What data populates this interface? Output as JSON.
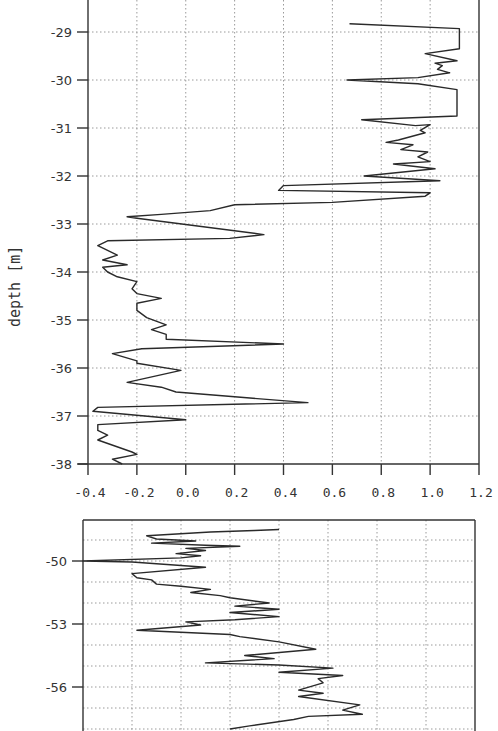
{
  "chart_data": [
    {
      "type": "line",
      "orientation": "profile (x = value, y = depth)",
      "title": "",
      "xlabel": "",
      "ylabel": "depth [m]",
      "xlim": [
        -0.4,
        1.2
      ],
      "ylim": [
        -38,
        -28.4
      ],
      "x_ticks": [
        "-0.4",
        "-0.2",
        "0.0",
        "0.2",
        "0.4",
        "0.6",
        "0.8",
        "1.0",
        "1.2"
      ],
      "y_ticks": [
        "-29",
        "-30",
        "-31",
        "-32",
        "-33",
        "-34",
        "-35",
        "-36",
        "-37",
        "-38"
      ],
      "grid": true,
      "series": [
        {
          "name": "profile",
          "points": [
            [
              0.67,
              -28.83
            ],
            [
              1.12,
              -28.93
            ],
            [
              1.12,
              -29.35
            ],
            [
              0.98,
              -29.45
            ],
            [
              1.11,
              -29.6
            ],
            [
              1.02,
              -29.65
            ],
            [
              1.05,
              -29.7
            ],
            [
              1.03,
              -29.78
            ],
            [
              1.08,
              -29.85
            ],
            [
              0.95,
              -29.95
            ],
            [
              0.66,
              -30.0
            ],
            [
              0.95,
              -30.08
            ],
            [
              1.11,
              -30.2
            ],
            [
              1.11,
              -30.75
            ],
            [
              0.72,
              -30.83
            ],
            [
              0.94,
              -30.95
            ],
            [
              1.0,
              -30.93
            ],
            [
              0.96,
              -31.05
            ],
            [
              0.98,
              -31.1
            ],
            [
              0.87,
              -31.25
            ],
            [
              0.82,
              -31.3
            ],
            [
              0.93,
              -31.35
            ],
            [
              0.88,
              -31.45
            ],
            [
              0.99,
              -31.5
            ],
            [
              0.95,
              -31.6
            ],
            [
              1.0,
              -31.7
            ],
            [
              0.85,
              -31.75
            ],
            [
              1.02,
              -31.85
            ],
            [
              0.73,
              -32.0
            ],
            [
              1.04,
              -32.1
            ],
            [
              0.4,
              -32.2
            ],
            [
              0.38,
              -32.3
            ],
            [
              1.0,
              -32.35
            ],
            [
              0.98,
              -32.42
            ],
            [
              0.6,
              -32.55
            ],
            [
              0.2,
              -32.6
            ],
            [
              0.1,
              -32.72
            ],
            [
              -0.1,
              -32.8
            ],
            [
              -0.24,
              -32.85
            ],
            [
              -0.2,
              -32.88
            ],
            [
              0.32,
              -33.22
            ],
            [
              0.18,
              -33.3
            ],
            [
              -0.32,
              -33.35
            ],
            [
              -0.36,
              -33.45
            ],
            [
              -0.28,
              -33.65
            ],
            [
              -0.34,
              -33.75
            ],
            [
              -0.24,
              -33.85
            ],
            [
              -0.34,
              -33.9
            ],
            [
              -0.32,
              -34.0
            ],
            [
              -0.28,
              -34.1
            ],
            [
              -0.2,
              -34.2
            ],
            [
              -0.22,
              -34.35
            ],
            [
              -0.2,
              -34.45
            ],
            [
              -0.1,
              -34.55
            ],
            [
              -0.2,
              -34.65
            ],
            [
              -0.2,
              -34.8
            ],
            [
              -0.16,
              -34.95
            ],
            [
              -0.08,
              -35.1
            ],
            [
              -0.14,
              -35.2
            ],
            [
              -0.08,
              -35.3
            ],
            [
              -0.08,
              -35.4
            ],
            [
              0.4,
              -35.5
            ],
            [
              -0.18,
              -35.6
            ],
            [
              -0.3,
              -35.7
            ],
            [
              -0.2,
              -35.85
            ],
            [
              -0.2,
              -35.9
            ],
            [
              -0.02,
              -36.05
            ],
            [
              -0.24,
              -36.3
            ],
            [
              -0.1,
              -36.4
            ],
            [
              -0.04,
              -36.5
            ],
            [
              0.2,
              -36.6
            ],
            [
              0.5,
              -36.72
            ],
            [
              -0.36,
              -36.82
            ],
            [
              -0.38,
              -36.9
            ],
            [
              0.0,
              -37.08
            ],
            [
              -0.36,
              -37.18
            ],
            [
              -0.36,
              -37.3
            ],
            [
              -0.32,
              -37.4
            ],
            [
              -0.36,
              -37.5
            ],
            [
              -0.22,
              -37.75
            ],
            [
              -0.2,
              -37.8
            ],
            [
              -0.3,
              -37.9
            ],
            [
              -0.26,
              -38.0
            ]
          ]
        }
      ]
    },
    {
      "type": "line",
      "orientation": "profile (x = value, y = depth)",
      "title": "",
      "xlabel": "",
      "ylabel": "",
      "xlim": [
        -0.4,
        1.2
      ],
      "ylim": [
        -48.0,
        -58.0
      ],
      "x_ticks": [],
      "y_ticks": [
        "-50",
        "-53",
        "-56"
      ],
      "grid": true,
      "note": "lower panel cropped at bottom edge of image; x gridlines appear at same 0.2 spacing as upper panel",
      "series": [
        {
          "name": "profile",
          "points": [
            [
              0.4,
              -48.5
            ],
            [
              0.3,
              -48.55
            ],
            [
              0.12,
              -48.62
            ],
            [
              -0.14,
              -48.8
            ],
            [
              -0.1,
              -48.95
            ],
            [
              0.06,
              -49.05
            ],
            [
              -0.12,
              -49.15
            ],
            [
              0.1,
              -49.25
            ],
            [
              0.24,
              -49.3
            ],
            [
              0.02,
              -49.4
            ],
            [
              0.1,
              -49.5
            ],
            [
              -0.02,
              -49.65
            ],
            [
              0.08,
              -49.75
            ],
            [
              0.0,
              -49.85
            ],
            [
              -0.4,
              -50.0
            ],
            [
              -0.2,
              -50.05
            ],
            [
              0.1,
              -50.3
            ],
            [
              -0.2,
              -50.6
            ],
            [
              -0.18,
              -50.8
            ],
            [
              -0.12,
              -50.9
            ],
            [
              -0.1,
              -51.1
            ],
            [
              0.0,
              -51.2
            ],
            [
              0.12,
              -51.35
            ],
            [
              0.04,
              -51.5
            ],
            [
              0.16,
              -51.65
            ],
            [
              0.2,
              -51.75
            ],
            [
              0.36,
              -52.0
            ],
            [
              0.22,
              -52.15
            ],
            [
              0.4,
              -52.3
            ],
            [
              0.2,
              -52.45
            ],
            [
              0.4,
              -52.65
            ],
            [
              0.22,
              -52.8
            ],
            [
              0.02,
              -52.9
            ],
            [
              0.08,
              -53.05
            ],
            [
              -0.18,
              -53.3
            ],
            [
              0.2,
              -53.5
            ],
            [
              0.24,
              -53.6
            ],
            [
              0.4,
              -53.85
            ],
            [
              0.55,
              -54.2
            ],
            [
              0.26,
              -54.5
            ],
            [
              0.38,
              -54.65
            ],
            [
              0.1,
              -54.85
            ],
            [
              0.4,
              -54.95
            ],
            [
              0.62,
              -55.1
            ],
            [
              0.4,
              -55.3
            ],
            [
              0.66,
              -55.45
            ],
            [
              0.56,
              -55.6
            ],
            [
              0.58,
              -55.8
            ],
            [
              0.48,
              -56.15
            ],
            [
              0.58,
              -56.3
            ],
            [
              0.48,
              -56.45
            ],
            [
              0.73,
              -56.85
            ],
            [
              0.66,
              -57.1
            ],
            [
              0.74,
              -57.3
            ],
            [
              0.52,
              -57.4
            ],
            [
              0.46,
              -57.55
            ],
            [
              0.28,
              -57.85
            ],
            [
              0.2,
              -58.0
            ]
          ]
        }
      ]
    }
  ],
  "labels": {
    "ylabel_top": "depth [m]",
    "top_y_ticks": [
      "-29",
      "-30",
      "-31",
      "-32",
      "-33",
      "-34",
      "-35",
      "-36",
      "-37",
      "-38"
    ],
    "top_x_ticks": [
      "-0.4",
      "-0.2",
      "0.0",
      "0.2",
      "0.4",
      "0.6",
      "0.8",
      "1.0",
      "1.2"
    ],
    "bottom_y_ticks": [
      "-50",
      "-53",
      "-56"
    ]
  }
}
